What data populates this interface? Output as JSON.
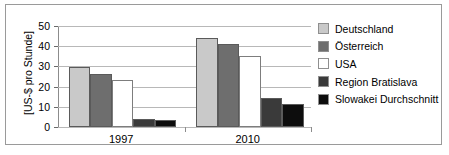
{
  "chart_data": {
    "type": "bar",
    "title": "",
    "xlabel": "",
    "ylabel": "[US-$ pro Stunde]",
    "categories": [
      "1997",
      "2010"
    ],
    "ylim": [
      0,
      50
    ],
    "yticks": [
      0,
      10,
      20,
      30,
      40,
      50
    ],
    "ytick_labels": [
      "0",
      "10",
      "20",
      "30",
      "40",
      "50"
    ],
    "grid": true,
    "legend_position": "right",
    "series": [
      {
        "name": "Deutschland",
        "color": "#c9c9c9",
        "values": [
          29.5,
          44.0
        ]
      },
      {
        "name": "Österreich",
        "color": "#6e6e6e",
        "values": [
          26.0,
          41.2
        ]
      },
      {
        "name": "USA",
        "color": "#ffffff",
        "values": [
          23.4,
          35.2
        ]
      },
      {
        "name": "Region Bratislava",
        "color": "#3a3a3a",
        "values": [
          4.1,
          14.5
        ]
      },
      {
        "name": "Slowakei Durchschnitt",
        "color": "#0d0d0d",
        "values": [
          3.4,
          11.6
        ]
      }
    ]
  }
}
